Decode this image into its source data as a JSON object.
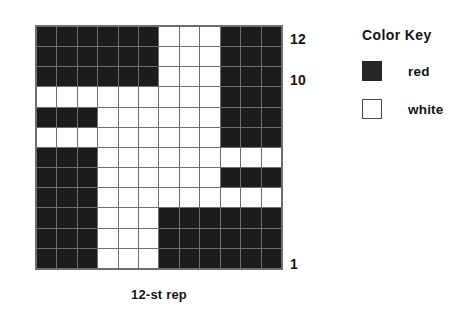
{
  "chart_data": {
    "type": "heatmap",
    "title": "",
    "caption": "12-st rep",
    "xlabel": "12-st rep",
    "ylabel": "",
    "grid": true,
    "rows": 12,
    "columns": 12,
    "legend_position": "right",
    "color_map": {
      "R": "red",
      "W": "white"
    },
    "colors": {
      "red": "#1c1c1c",
      "white": "#ffffff",
      "gridline": "#6e6e6e"
    },
    "row_tick_labels": [
      "12",
      "10",
      "1"
    ],
    "row_ticks": [
      12,
      10,
      1
    ],
    "row_order": "top row is 12, bottom row is 1",
    "cells": [
      [
        "R",
        "R",
        "R",
        "R",
        "R",
        "R",
        "W",
        "W",
        "W",
        "R",
        "R",
        "R"
      ],
      [
        "R",
        "R",
        "R",
        "R",
        "R",
        "R",
        "W",
        "W",
        "W",
        "R",
        "R",
        "R"
      ],
      [
        "R",
        "R",
        "R",
        "R",
        "R",
        "R",
        "W",
        "W",
        "W",
        "R",
        "R",
        "R"
      ],
      [
        "W",
        "W",
        "W",
        "W",
        "W",
        "W",
        "W",
        "W",
        "W",
        "R",
        "R",
        "R"
      ],
      [
        "R",
        "R",
        "R",
        "W",
        "W",
        "W",
        "W",
        "W",
        "W",
        "R",
        "R",
        "R"
      ],
      [
        "W",
        "W",
        "W",
        "W",
        "W",
        "W",
        "W",
        "W",
        "W",
        "R",
        "R",
        "R"
      ],
      [
        "R",
        "R",
        "R",
        "W",
        "W",
        "W",
        "W",
        "W",
        "W",
        "W",
        "W",
        "W"
      ],
      [
        "R",
        "R",
        "R",
        "W",
        "W",
        "W",
        "W",
        "W",
        "W",
        "R",
        "R",
        "R"
      ],
      [
        "R",
        "R",
        "R",
        "W",
        "W",
        "W",
        "W",
        "W",
        "W",
        "W",
        "W",
        "W"
      ],
      [
        "R",
        "R",
        "R",
        "W",
        "W",
        "W",
        "R",
        "R",
        "R",
        "R",
        "R",
        "R"
      ],
      [
        "R",
        "R",
        "R",
        "W",
        "W",
        "W",
        "R",
        "R",
        "R",
        "R",
        "R",
        "R"
      ],
      [
        "R",
        "R",
        "R",
        "W",
        "W",
        "W",
        "R",
        "R",
        "R",
        "R",
        "R",
        "R"
      ]
    ]
  },
  "axis": {
    "row_label_top": "12",
    "row_label_mid": "10",
    "row_label_bottom": "1"
  },
  "caption": {
    "text": "12-st rep"
  },
  "legend": {
    "title": "Color  Key",
    "items": [
      {
        "swatch": "red-swatch",
        "label": "red"
      },
      {
        "swatch": "white-swatch",
        "label": "white"
      }
    ]
  }
}
